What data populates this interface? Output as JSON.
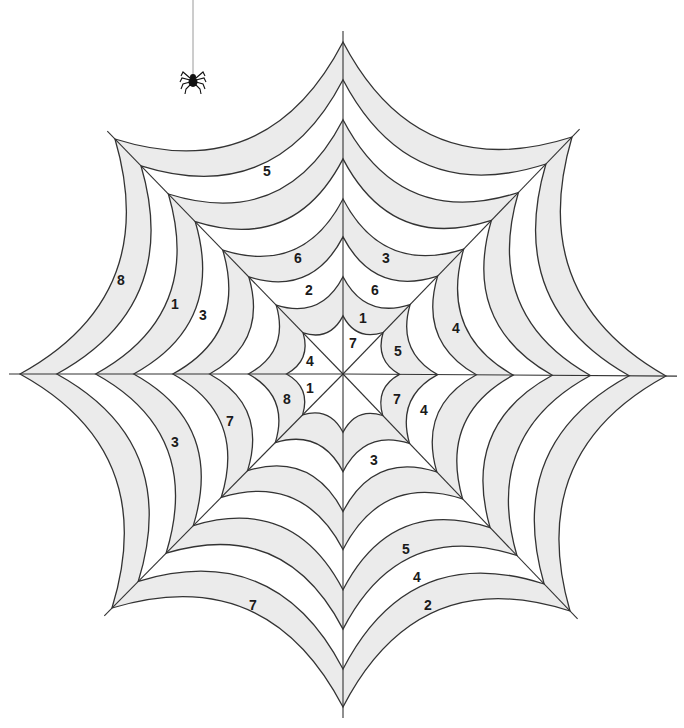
{
  "image": {
    "title": "Spider web color-by-number puzzle",
    "width": 684,
    "height": 728
  },
  "colors": {
    "background": "#ffffff",
    "band_fill": "#ebebeb",
    "line": "#333333",
    "text": "#1a1a1a",
    "spider": "#111111",
    "thread": "#9a9a9a"
  },
  "web": {
    "center": [
      343,
      374
    ],
    "spoke_count": 8,
    "spoke_extension": 11,
    "ring_vertices": {
      "comment_order": "angles: up, up-right, right, down-right, down, down-left, left, up-left",
      "outer": [
        [
          343,
          42
        ],
        [
          572,
          137
        ],
        [
          666,
          376
        ],
        [
          570,
          611
        ],
        [
          343,
          707
        ],
        [
          112,
          608
        ],
        [
          20,
          374
        ],
        [
          115,
          139
        ]
      ]
    },
    "ring_fractions": [
      0.175,
      0.293,
      0.413,
      0.527,
      0.648,
      0.766,
      0.886,
      1.0
    ],
    "ring_sag": [
      0.34,
      0.34,
      0.34,
      0.34,
      0.34,
      0.34,
      0.34,
      0.34
    ],
    "band_shading": [
      "white",
      "gray",
      "white",
      "gray",
      "white",
      "gray",
      "white",
      "gray"
    ]
  },
  "spider": {
    "thread_top": [
      193,
      0
    ],
    "body": [
      193,
      80
    ]
  },
  "labels": [
    {
      "text": "5",
      "x": 267,
      "y": 172
    },
    {
      "text": "8",
      "x": 121,
      "y": 281
    },
    {
      "text": "1",
      "x": 175,
      "y": 305
    },
    {
      "text": "3",
      "x": 203,
      "y": 316
    },
    {
      "text": "6",
      "x": 298,
      "y": 259
    },
    {
      "text": "3",
      "x": 386,
      "y": 259
    },
    {
      "text": "2",
      "x": 309,
      "y": 291
    },
    {
      "text": "6",
      "x": 375,
      "y": 291
    },
    {
      "text": "1",
      "x": 363,
      "y": 319
    },
    {
      "text": "7",
      "x": 353,
      "y": 344
    },
    {
      "text": "5",
      "x": 398,
      "y": 352
    },
    {
      "text": "4",
      "x": 310,
      "y": 362
    },
    {
      "text": "4",
      "x": 456,
      "y": 329
    },
    {
      "text": "1",
      "x": 310,
      "y": 389
    },
    {
      "text": "8",
      "x": 287,
      "y": 400
    },
    {
      "text": "7",
      "x": 397,
      "y": 400
    },
    {
      "text": "4",
      "x": 424,
      "y": 411
    },
    {
      "text": "7",
      "x": 230,
      "y": 422
    },
    {
      "text": "3",
      "x": 175,
      "y": 443
    },
    {
      "text": "3",
      "x": 374,
      "y": 461
    },
    {
      "text": "5",
      "x": 406,
      "y": 550
    },
    {
      "text": "4",
      "x": 417,
      "y": 578
    },
    {
      "text": "2",
      "x": 428,
      "y": 606
    },
    {
      "text": "7",
      "x": 253,
      "y": 606
    }
  ]
}
